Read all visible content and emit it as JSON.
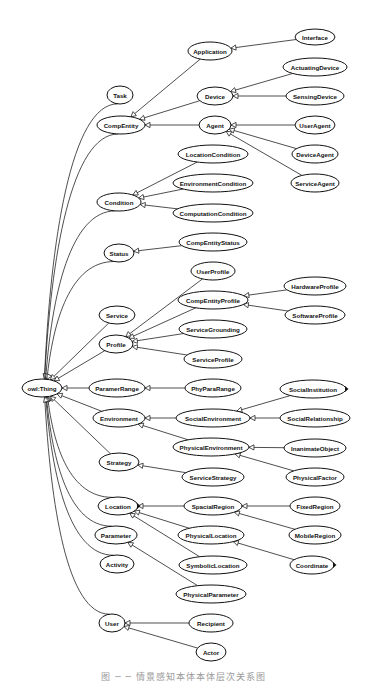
{
  "diagram": {
    "root": "owl:Thing",
    "nodes": [
      {
        "id": "owl:Thing",
        "label": "owl:Thing",
        "x": 42,
        "y": 388,
        "rx": 20,
        "ry": 9
      },
      {
        "id": "Task",
        "label": "Task",
        "x": 120,
        "y": 95,
        "rx": 13,
        "ry": 9
      },
      {
        "id": "CompEntity",
        "label": "CompEntity",
        "x": 121,
        "y": 125,
        "rx": 24,
        "ry": 9
      },
      {
        "id": "Application",
        "label": "Application",
        "x": 210,
        "y": 51,
        "rx": 22,
        "ry": 9
      },
      {
        "id": "Interface",
        "label": "Interface",
        "x": 315,
        "y": 37,
        "rx": 20,
        "ry": 8
      },
      {
        "id": "Device",
        "label": "Device",
        "x": 215,
        "y": 96,
        "rx": 18,
        "ry": 9
      },
      {
        "id": "ActuatingDevice",
        "label": "ActuatingDevice",
        "x": 315,
        "y": 67,
        "rx": 32,
        "ry": 9
      },
      {
        "id": "SensingDevice",
        "label": "SensingDevice",
        "x": 315,
        "y": 96,
        "rx": 29,
        "ry": 9
      },
      {
        "id": "Agent",
        "label": "Agent",
        "x": 215,
        "y": 125,
        "rx": 16,
        "ry": 9
      },
      {
        "id": "UserAgent",
        "label": "UserAgent",
        "x": 315,
        "y": 125,
        "rx": 20,
        "ry": 9
      },
      {
        "id": "DeviceAgent",
        "label": "DeviceAgent",
        "x": 315,
        "y": 154,
        "rx": 23,
        "ry": 9
      },
      {
        "id": "ServiceAgent",
        "label": "ServiceAgent",
        "x": 315,
        "y": 183,
        "rx": 24,
        "ry": 9
      },
      {
        "id": "Condition",
        "label": "Condition",
        "x": 119,
        "y": 202,
        "rx": 22,
        "ry": 9
      },
      {
        "id": "LocationCondition",
        "label": "LocationCondition",
        "x": 213,
        "y": 154,
        "rx": 35,
        "ry": 9
      },
      {
        "id": "EnvironmentCondition",
        "label": "EnvironmentCondition",
        "x": 213,
        "y": 183,
        "rx": 40,
        "ry": 9
      },
      {
        "id": "ComputationCondition",
        "label": "ComputationCondition",
        "x": 213,
        "y": 213,
        "rx": 40,
        "ry": 9
      },
      {
        "id": "Status",
        "label": "Status",
        "x": 119,
        "y": 253,
        "rx": 15,
        "ry": 9
      },
      {
        "id": "CompEntityStatus",
        "label": "CompEntityStatus",
        "x": 213,
        "y": 242,
        "rx": 34,
        "ry": 9
      },
      {
        "id": "UserProfile",
        "label": "UserProfile",
        "x": 213,
        "y": 271,
        "rx": 22,
        "ry": 9
      },
      {
        "id": "CompEntityProfile",
        "label": "CompEntityProfile",
        "x": 213,
        "y": 300,
        "rx": 35,
        "ry": 9
      },
      {
        "id": "HardwareProfile",
        "label": "HardwareProfile",
        "x": 315,
        "y": 286,
        "rx": 31,
        "ry": 9
      },
      {
        "id": "SoftwareProfile",
        "label": "SoftwareProfile",
        "x": 315,
        "y": 315,
        "rx": 30,
        "ry": 9
      },
      {
        "id": "Service",
        "label": "Service",
        "x": 117,
        "y": 315,
        "rx": 18,
        "ry": 9
      },
      {
        "id": "Profile",
        "label": "Profile",
        "x": 116,
        "y": 344,
        "rx": 17,
        "ry": 9
      },
      {
        "id": "ServiceGrounding",
        "label": "ServiceGrounding",
        "x": 213,
        "y": 329,
        "rx": 34,
        "ry": 9
      },
      {
        "id": "ServiceProfile",
        "label": "ServiceProfile",
        "x": 213,
        "y": 359,
        "rx": 29,
        "ry": 9
      },
      {
        "id": "ParamerRange",
        "label": "ParamerRange",
        "x": 117,
        "y": 388,
        "rx": 28,
        "ry": 9
      },
      {
        "id": "PhyParaRange",
        "label": "PhyParaRange",
        "x": 213,
        "y": 388,
        "rx": 28,
        "ry": 9
      },
      {
        "id": "Environment",
        "label": "Environment",
        "x": 119,
        "y": 418,
        "rx": 26,
        "ry": 9
      },
      {
        "id": "SocialEnvironment",
        "label": "SocialEnvironment",
        "x": 213,
        "y": 418,
        "rx": 37,
        "ry": 9
      },
      {
        "id": "SocialInstitution",
        "label": "SocialInstitution",
        "x": 313,
        "y": 389,
        "rx": 33,
        "ry": 9,
        "marker": true
      },
      {
        "id": "SocialRelationship",
        "label": "SocialRelationship",
        "x": 315,
        "y": 418,
        "rx": 35,
        "ry": 9
      },
      {
        "id": "PhysicalEnvironment",
        "label": "PhysicalEnvironment",
        "x": 211,
        "y": 447,
        "rx": 38,
        "ry": 9
      },
      {
        "id": "InanimateObject",
        "label": "InanimateObject",
        "x": 315,
        "y": 448,
        "rx": 31,
        "ry": 9
      },
      {
        "id": "PhysicalFactor",
        "label": "PhysicalFactor",
        "x": 315,
        "y": 477,
        "rx": 29,
        "ry": 9
      },
      {
        "id": "Strategy",
        "label": "Strategy",
        "x": 119,
        "y": 462,
        "rx": 20,
        "ry": 9
      },
      {
        "id": "ServiceStrategy",
        "label": "ServiceStrategy",
        "x": 213,
        "y": 477,
        "rx": 31,
        "ry": 9
      },
      {
        "id": "Location",
        "label": "Location",
        "x": 118,
        "y": 506,
        "rx": 20,
        "ry": 9,
        "marker": true
      },
      {
        "id": "SpacialRegion",
        "label": "SpacialRegion",
        "x": 213,
        "y": 506,
        "rx": 29,
        "ry": 9
      },
      {
        "id": "FixedRegion",
        "label": "FixedRegion",
        "x": 315,
        "y": 506,
        "rx": 25,
        "ry": 9
      },
      {
        "id": "MobileRegion",
        "label": "MobileRegion",
        "x": 315,
        "y": 535,
        "rx": 26,
        "ry": 9
      },
      {
        "id": "PhysicalLocation",
        "label": "PhysicalLocation",
        "x": 211,
        "y": 535,
        "rx": 33,
        "ry": 9
      },
      {
        "id": "Coordinate",
        "label": "Coordinate",
        "x": 312,
        "y": 565,
        "rx": 22,
        "ry": 9,
        "marker": true
      },
      {
        "id": "Parameter",
        "label": "Parameter",
        "x": 116,
        "y": 535,
        "rx": 21,
        "ry": 9
      },
      {
        "id": "SymbolicLocation",
        "label": "SymbolicLocation",
        "x": 213,
        "y": 565,
        "rx": 34,
        "ry": 9
      },
      {
        "id": "Activity",
        "label": "Activity",
        "x": 117,
        "y": 564,
        "rx": 17,
        "ry": 9
      },
      {
        "id": "PhysicalParameter",
        "label": "PhysicalParameter",
        "x": 211,
        "y": 594,
        "rx": 35,
        "ry": 9
      },
      {
        "id": "User",
        "label": "User",
        "x": 112,
        "y": 623,
        "rx": 13,
        "ry": 9
      },
      {
        "id": "Recipient",
        "label": "Recipient",
        "x": 211,
        "y": 623,
        "rx": 22,
        "ry": 9
      },
      {
        "id": "Actor",
        "label": "Actor",
        "x": 211,
        "y": 652,
        "rx": 15,
        "ry": 9
      }
    ],
    "edges": [
      {
        "child": "Task",
        "parent": "owl:Thing"
      },
      {
        "child": "CompEntity",
        "parent": "owl:Thing"
      },
      {
        "child": "Condition",
        "parent": "owl:Thing"
      },
      {
        "child": "Status",
        "parent": "owl:Thing"
      },
      {
        "child": "Service",
        "parent": "owl:Thing"
      },
      {
        "child": "Profile",
        "parent": "owl:Thing"
      },
      {
        "child": "ParamerRange",
        "parent": "owl:Thing"
      },
      {
        "child": "Environment",
        "parent": "owl:Thing"
      },
      {
        "child": "Strategy",
        "parent": "owl:Thing"
      },
      {
        "child": "Location",
        "parent": "owl:Thing"
      },
      {
        "child": "Parameter",
        "parent": "owl:Thing"
      },
      {
        "child": "Activity",
        "parent": "owl:Thing"
      },
      {
        "child": "User",
        "parent": "owl:Thing"
      },
      {
        "child": "Application",
        "parent": "CompEntity"
      },
      {
        "child": "Device",
        "parent": "CompEntity"
      },
      {
        "child": "Agent",
        "parent": "CompEntity"
      },
      {
        "child": "Interface",
        "parent": "Application"
      },
      {
        "child": "ActuatingDevice",
        "parent": "Device"
      },
      {
        "child": "SensingDevice",
        "parent": "Device"
      },
      {
        "child": "UserAgent",
        "parent": "Agent"
      },
      {
        "child": "DeviceAgent",
        "parent": "Agent"
      },
      {
        "child": "ServiceAgent",
        "parent": "Agent"
      },
      {
        "child": "LocationCondition",
        "parent": "Condition"
      },
      {
        "child": "EnvironmentCondition",
        "parent": "Condition"
      },
      {
        "child": "ComputationCondition",
        "parent": "Condition"
      },
      {
        "child": "CompEntityStatus",
        "parent": "Status"
      },
      {
        "child": "UserProfile",
        "parent": "Profile"
      },
      {
        "child": "CompEntityProfile",
        "parent": "Profile"
      },
      {
        "child": "ServiceGrounding",
        "parent": "Profile"
      },
      {
        "child": "ServiceProfile",
        "parent": "Profile"
      },
      {
        "child": "HardwareProfile",
        "parent": "CompEntityProfile"
      },
      {
        "child": "SoftwareProfile",
        "parent": "CompEntityProfile"
      },
      {
        "child": "PhyParaRange",
        "parent": "ParamerRange"
      },
      {
        "child": "SocialEnvironment",
        "parent": "Environment"
      },
      {
        "child": "PhysicalEnvironment",
        "parent": "Environment"
      },
      {
        "child": "SocialInstitution",
        "parent": "SocialEnvironment"
      },
      {
        "child": "SocialRelationship",
        "parent": "SocialEnvironment"
      },
      {
        "child": "InanimateObject",
        "parent": "PhysicalEnvironment"
      },
      {
        "child": "PhysicalFactor",
        "parent": "PhysicalEnvironment"
      },
      {
        "child": "ServiceStrategy",
        "parent": "Strategy"
      },
      {
        "child": "SpacialRegion",
        "parent": "Location"
      },
      {
        "child": "PhysicalLocation",
        "parent": "Location"
      },
      {
        "child": "SymbolicLocation",
        "parent": "Location"
      },
      {
        "child": "FixedRegion",
        "parent": "SpacialRegion"
      },
      {
        "child": "MobileRegion",
        "parent": "SpacialRegion"
      },
      {
        "child": "Coordinate",
        "parent": "PhysicalLocation"
      },
      {
        "child": "PhysicalParameter",
        "parent": "Parameter"
      },
      {
        "child": "Recipient",
        "parent": "User"
      },
      {
        "child": "Actor",
        "parent": "User"
      }
    ],
    "colors": {
      "stroke": "#111111",
      "fill": "#ffffff",
      "background": "#ffffff"
    }
  },
  "caption": "图 ─ ─ 情景感知本体本体层次关系图"
}
